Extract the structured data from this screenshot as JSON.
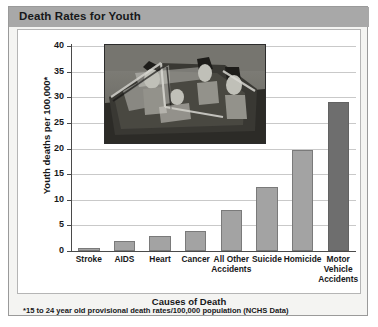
{
  "title": "Death Rates for Youth",
  "footnote": "*15 to 24 year old provisional death rates/100,000 population (NCHS Data)",
  "photo": {
    "alt_name": "teens-in-convertible-photo"
  },
  "colors": {
    "title_bar": "#a8a8a8",
    "card_background": "#f4f4f2",
    "plot_background": "#ffffff",
    "bar_default": "#a3a3a3",
    "bar_highlight": "#6e6e6e",
    "gridline": "#c9c9c9",
    "axis": "#4a4a4a",
    "text": "#17181a"
  },
  "chart_data": {
    "type": "bar",
    "title": "Death Rates for Youth",
    "xlabel": "Causes of Death",
    "ylabel": "Youth deaths per 100,000*",
    "categories": [
      "Stroke",
      "AIDS",
      "Heart",
      "Cancer",
      "All Other Accidents",
      "Suicide",
      "Homicide",
      "Motor Vehicle Accidents"
    ],
    "values": [
      0.5,
      2,
      3,
      4,
      8,
      12.5,
      19.8,
      29
    ],
    "bar_colors": [
      "#a3a3a3",
      "#a3a3a3",
      "#a3a3a3",
      "#a3a3a3",
      "#a3a3a3",
      "#a3a3a3",
      "#a3a3a3",
      "#6e6e6e"
    ],
    "ylim": [
      0,
      40
    ],
    "yticks": [
      0,
      5,
      10,
      15,
      20,
      25,
      30,
      35,
      40
    ],
    "ytick_labels": [
      "0",
      "5",
      "10",
      "15",
      "20",
      "25",
      "30",
      "35",
      "40"
    ],
    "grid": true,
    "legend": null
  }
}
